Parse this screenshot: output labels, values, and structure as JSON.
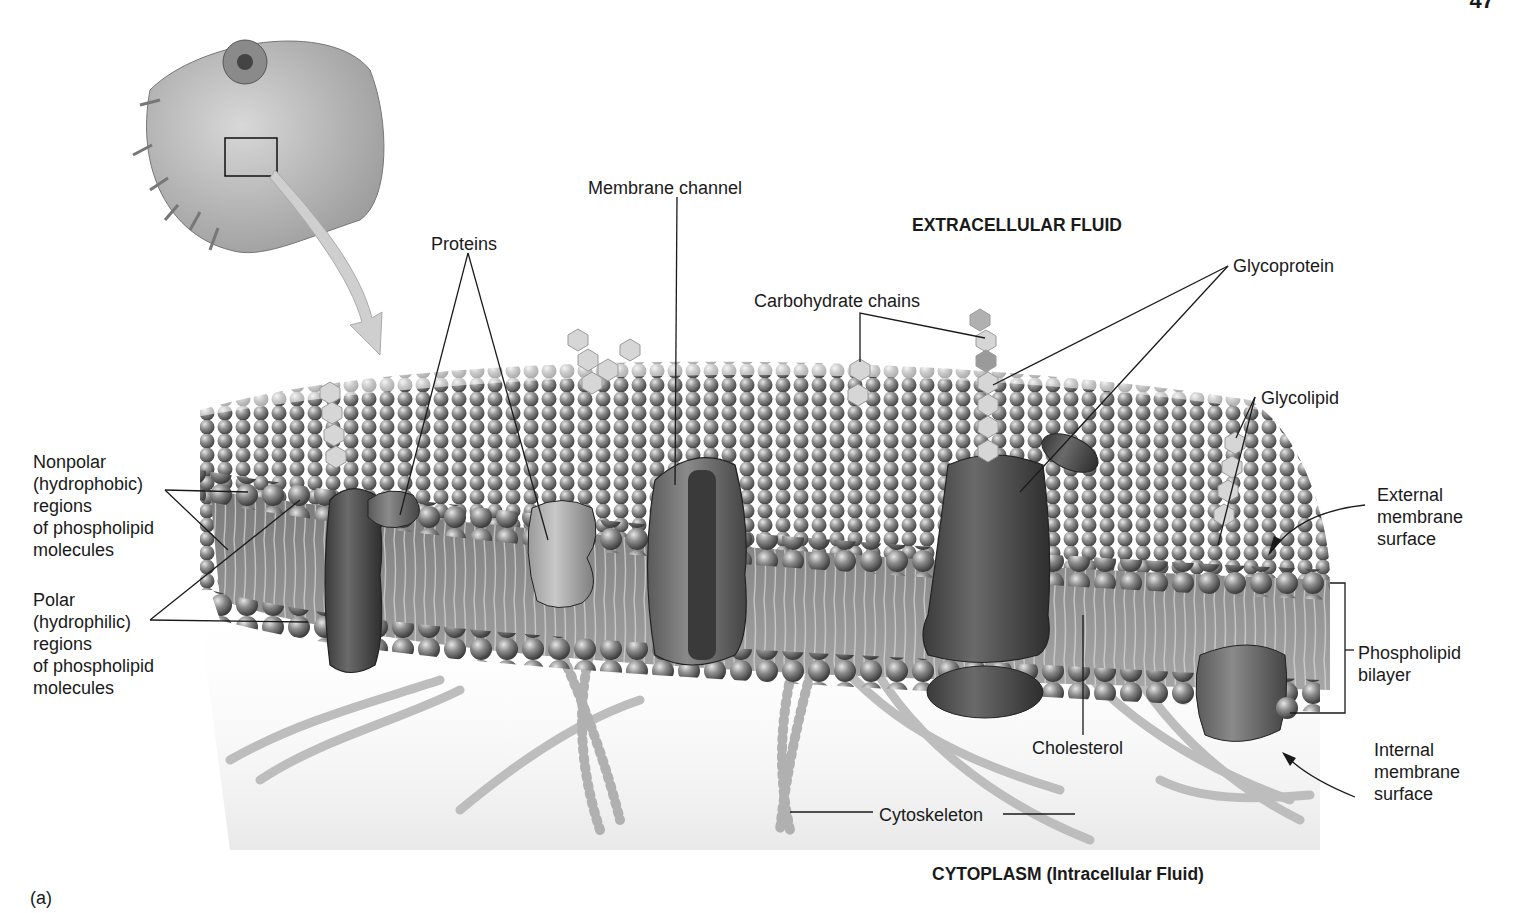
{
  "page_number": "47",
  "figure_tag": "(a)",
  "regions": {
    "extracellular": "EXTRACELLULAR FLUID",
    "cytoplasm": "CYTOPLASM (Intracellular Fluid)"
  },
  "labels": {
    "membrane_channel": "Membrane channel",
    "proteins": "Proteins",
    "carbohydrate_chains": "Carbohydrate chains",
    "glycoprotein": "Glycoprotein",
    "glycolipid": "Glycolipid",
    "nonpolar": "Nonpolar\n(hydrophobic)\nregions\nof phospholipid\nmolecules",
    "polar": "Polar\n(hydrophilic)\nregions\nof phospholipid\nmolecules",
    "external_surface": "External\nmembrane\nsurface",
    "phospholipid_bilayer": "Phospholipid\nbilayer",
    "internal_surface": "Internal\nmembrane\nsurface",
    "cholesterol": "Cholesterol",
    "cytoskeleton": "Cytoskeleton"
  },
  "colors": {
    "ink": "#1a1a1a",
    "lipid_head": "#8a8a8a",
    "protein_dark": "#4a4a4a",
    "protein_light": "#a8a8a8",
    "background": "#ffffff"
  }
}
